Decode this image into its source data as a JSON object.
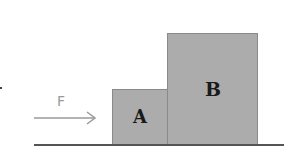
{
  "diagram": {
    "force": {
      "label": "F",
      "direction": "right",
      "color": "#9a9a9a"
    },
    "blocks": [
      {
        "label": "A",
        "fill": "#acacac",
        "size": "small"
      },
      {
        "label": "B",
        "fill": "#acacac",
        "size": "large"
      }
    ],
    "ground": {
      "color": "#555555"
    }
  }
}
